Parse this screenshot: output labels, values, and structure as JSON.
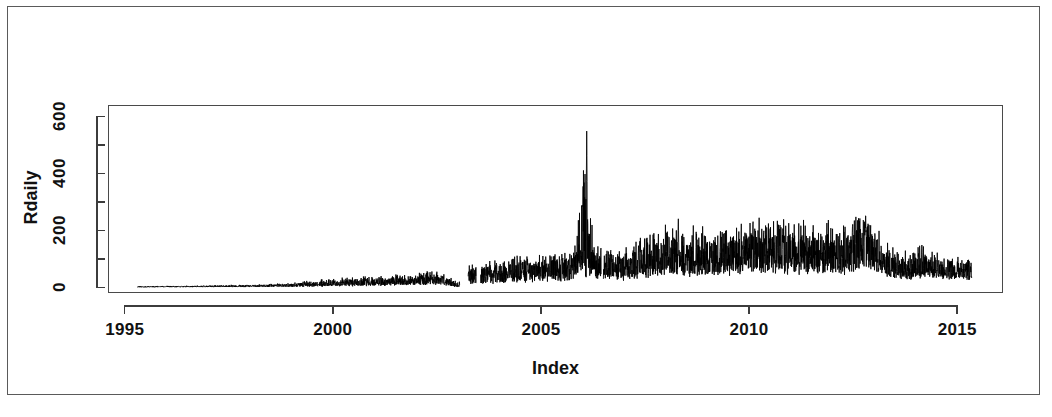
{
  "figure": {
    "frame_color": "#5a5a5a",
    "background": "#ffffff",
    "axis_color": "#3c3c3c",
    "series_color": "#000000"
  },
  "chart_data": {
    "type": "line",
    "title": "",
    "subtitle": "",
    "xlabel": "Index",
    "ylabel": "Rdaily",
    "xlim": [
      1994.6,
      2016.1
    ],
    "ylim": [
      -20,
      640
    ],
    "grid": false,
    "legend": null,
    "legend_position": "none",
    "x_ticks": [
      1995,
      2000,
      2005,
      2010,
      2015
    ],
    "x_tick_labels": [
      "1995",
      "2000",
      "2005",
      "2010",
      "2015"
    ],
    "y_ticks": [
      0,
      200,
      400,
      600
    ],
    "y_tick_labels": [
      "0",
      "200",
      "400",
      "600"
    ],
    "y_minor_ticks": [
      100,
      300,
      500
    ],
    "annotations": [],
    "series": [
      {
        "name": "Rdaily",
        "color": "#000000",
        "description": "Daily series: flat near zero 1995-1999, volatility grows through 2000-2005, extreme spike reaching ~595 in early 2006, dense band 50-300 through 2007-2012, secondary hump ~290 in late 2012, spike ~160 in 2014, series ends mid-2015.",
        "x_start": 1995.3,
        "x_end": 2015.35,
        "envelope": {
          "x": [
            1995.3,
            1996.0,
            1997.0,
            1998.0,
            1999.0,
            1999.6,
            2000.2,
            2000.8,
            2001.4,
            2002.0,
            2002.5,
            2003.0,
            2003.3,
            2003.8,
            2004.3,
            2004.8,
            2005.3,
            2005.8,
            2006.05,
            2006.15,
            2006.3,
            2006.5,
            2007.0,
            2007.5,
            2008.0,
            2008.4,
            2008.9,
            2009.4,
            2009.9,
            2010.4,
            2010.9,
            2011.4,
            2011.9,
            2012.4,
            2012.8,
            2013.0,
            2013.4,
            2013.9,
            2014.1,
            2014.4,
            2014.9,
            2015.35
          ],
          "upper": [
            4,
            5,
            7,
            10,
            16,
            26,
            34,
            40,
            46,
            52,
            62,
            18,
            82,
            96,
            104,
            112,
            120,
            132,
            595,
            330,
            150,
            140,
            150,
            175,
            250,
            200,
            215,
            205,
            235,
            270,
            245,
            230,
            235,
            230,
            295,
            240,
            140,
            130,
            160,
            120,
            110,
            105
          ],
          "lower": [
            0,
            0,
            0,
            0,
            0,
            0,
            1,
            1,
            2,
            2,
            3,
            0,
            4,
            5,
            6,
            7,
            8,
            9,
            20,
            25,
            18,
            14,
            16,
            20,
            28,
            24,
            26,
            26,
            30,
            34,
            32,
            30,
            32,
            32,
            45,
            38,
            22,
            20,
            26,
            20,
            18,
            16
          ],
          "median": [
            1,
            2,
            3,
            4,
            6,
            10,
            14,
            17,
            20,
            23,
            28,
            4,
            38,
            45,
            50,
            54,
            58,
            64,
            120,
            110,
            70,
            66,
            70,
            82,
            105,
            92,
            98,
            96,
            108,
            120,
            112,
            106,
            110,
            108,
            140,
            118,
            66,
            62,
            74,
            58,
            54,
            50
          ]
        },
        "gaps": [
          [
            2003.05,
            2003.25
          ],
          [
            2003.45,
            2003.55
          ],
          [
            2006.45,
            2006.5
          ]
        ],
        "peaks": [
          {
            "x": 2006.1,
            "y": 595,
            "label": ""
          },
          {
            "x": 2012.8,
            "y": 295,
            "label": ""
          },
          {
            "x": 2008.3,
            "y": 250,
            "label": ""
          },
          {
            "x": 2014.15,
            "y": 160,
            "label": ""
          }
        ]
      }
    ]
  }
}
